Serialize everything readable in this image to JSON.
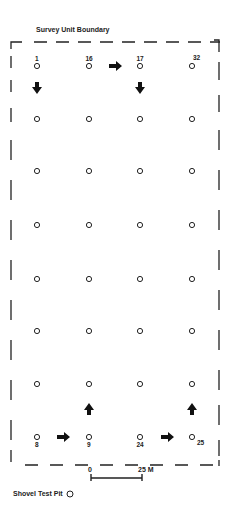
{
  "title": "Survey Unit Boundary",
  "legend": {
    "label": "Shovel Test Pit",
    "symbol": "circle"
  },
  "scale": {
    "start_label": "0",
    "end_label": "25 M"
  },
  "grid": {
    "columns_x": [
      37,
      89,
      140,
      192
    ],
    "rows_y": [
      66,
      119,
      171,
      225,
      279,
      331,
      384,
      437
    ],
    "labeled_pits": [
      {
        "id": "1",
        "col": 0,
        "row": 0,
        "pos": "above"
      },
      {
        "id": "16",
        "col": 1,
        "row": 0,
        "pos": "above"
      },
      {
        "id": "17",
        "col": 2,
        "row": 0,
        "pos": "above"
      },
      {
        "id": "32",
        "col": 3,
        "row": 0,
        "pos": "above-right"
      },
      {
        "id": "8",
        "col": 0,
        "row": 7,
        "pos": "below"
      },
      {
        "id": "9",
        "col": 1,
        "row": 7,
        "pos": "below"
      },
      {
        "id": "24",
        "col": 2,
        "row": 7,
        "pos": "below"
      },
      {
        "id": "25",
        "col": 3,
        "row": 7,
        "pos": "below-right"
      }
    ]
  },
  "arrows": [
    {
      "dir": "down",
      "x": 37,
      "y": 88
    },
    {
      "dir": "right",
      "x": 115,
      "y": 66
    },
    {
      "dir": "down",
      "x": 140,
      "y": 88
    },
    {
      "dir": "up",
      "x": 89,
      "y": 409
    },
    {
      "dir": "up",
      "x": 192,
      "y": 409
    },
    {
      "dir": "right",
      "x": 63,
      "y": 437
    },
    {
      "dir": "right",
      "x": 167,
      "y": 437
    }
  ]
}
